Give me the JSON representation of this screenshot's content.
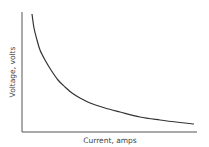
{
  "chart_data": {
    "type": "line",
    "title": "",
    "xlabel": "Current, amps",
    "ylabel": "Voltage, volts",
    "grid": false,
    "legend": null,
    "ticks": false,
    "series": [
      {
        "name": "Voltage vs Current",
        "color": "#333333",
        "points_px": [
          [
            32,
            14
          ],
          [
            34,
            28
          ],
          [
            37,
            40
          ],
          [
            40,
            50
          ],
          [
            45,
            60
          ],
          [
            51,
            70
          ],
          [
            58,
            80
          ],
          [
            65,
            87
          ],
          [
            72,
            93
          ],
          [
            80,
            98
          ],
          [
            90,
            103
          ],
          [
            105,
            108
          ],
          [
            120,
            112
          ],
          [
            140,
            117
          ],
          [
            160,
            120
          ],
          [
            180,
            122.5
          ],
          [
            194,
            124
          ]
        ]
      }
    ],
    "axes": {
      "origin_px": [
        22,
        132
      ],
      "y_top_px": 12,
      "x_end_px": 197,
      "color": "#555555"
    }
  }
}
